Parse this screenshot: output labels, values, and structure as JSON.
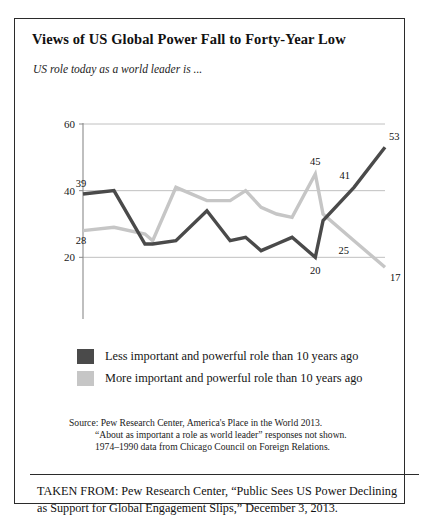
{
  "figure": {
    "title": "Views of US Global Power Fall to Forty-Year Low",
    "subtitle": "US role today as a world leader is ...",
    "source_line_1": "Source: Pew Research Center, America's Place in the World 2013.",
    "source_line_2": "“About as important a role as world leader” responses not shown.",
    "source_line_3": "1974–1990 data from Chicago Council on Foreign Relations.",
    "taken_from": "TAKEN FROM: Pew Research Center, “Public Sees US Power Declining as Support for Global Engagement Slips,” December 3, 2013."
  },
  "colors": {
    "series_less": "#4a4a4a",
    "series_more": "#c6c6c6",
    "grid": "#b9b9b9",
    "axis": "#8a8a8a",
    "border": "#2b2b2b",
    "text": "#1a1a1a"
  },
  "chart_data": {
    "type": "line",
    "title": "Views of US Global Power Fall to Forty-Year Low",
    "subtitle": "US role today as a world leader is ...",
    "xlabel": "",
    "ylabel": "",
    "xlim": [
      1974,
      2013
    ],
    "ylim": [
      0,
      60
    ],
    "yticks": [
      0,
      20,
      40,
      60
    ],
    "xticks": [
      1974,
      1984,
      1994,
      2004,
      2013
    ],
    "xtick_labels": [
      "1974",
      "1984",
      "1994",
      "2004",
      "2013"
    ],
    "ytick_labels": [
      "0",
      "20",
      "40",
      "60"
    ],
    "grid": true,
    "legend_position": "below",
    "series": [
      {
        "name": "Less important and powerful role than 10 years ago",
        "color": "#4a4a4a",
        "x": [
          1974,
          1978,
          1982,
          1983,
          1986,
          1990,
          1993,
          1995,
          1997,
          1999,
          2001,
          2004,
          2005,
          2009,
          2013
        ],
        "values": [
          39,
          40,
          24,
          24,
          25,
          34,
          25,
          26,
          22,
          24,
          26,
          20,
          31,
          41,
          53
        ]
      },
      {
        "name": "More important and powerful role than 10 years ago",
        "color": "#c6c6c6",
        "x": [
          1974,
          1978,
          1982,
          1983,
          1986,
          1990,
          1993,
          1995,
          1997,
          1999,
          2001,
          2004,
          2005,
          2009,
          2013
        ],
        "values": [
          28,
          29,
          27,
          25,
          41,
          37,
          37,
          40,
          35,
          33,
          32,
          45,
          33,
          25,
          17
        ]
      }
    ],
    "annotations": [
      {
        "text": "39",
        "x": 1974,
        "y": 39,
        "series": "less"
      },
      {
        "text": "28",
        "x": 1974,
        "y": 28,
        "series": "more"
      },
      {
        "text": "45",
        "x": 2004,
        "y": 45,
        "series": "more"
      },
      {
        "text": "20",
        "x": 2004,
        "y": 20,
        "series": "less"
      },
      {
        "text": "41",
        "x": 2009,
        "y": 41,
        "series": "less"
      },
      {
        "text": "25",
        "x": 2009,
        "y": 25,
        "series": "more"
      },
      {
        "text": "53",
        "x": 2013,
        "y": 53,
        "series": "less"
      },
      {
        "text": "17",
        "x": 2013,
        "y": 17,
        "series": "more"
      }
    ]
  },
  "legend": {
    "items": [
      {
        "label": "Less important and powerful role than 10 years ago",
        "color": "#4a4a4a"
      },
      {
        "label": "More important and powerful role than 10 years ago",
        "color": "#c6c6c6"
      }
    ]
  }
}
